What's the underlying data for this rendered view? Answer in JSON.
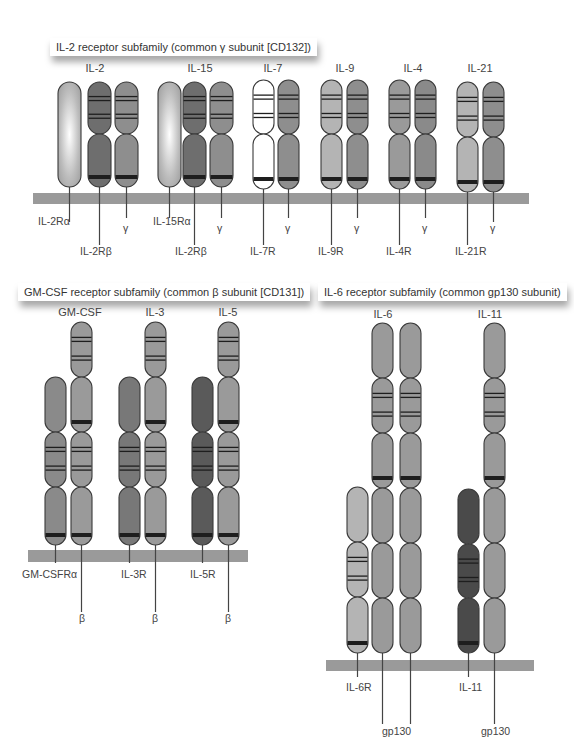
{
  "colors": {
    "membrane": "#9a9a9a",
    "outline": "#3a3a3a",
    "band": "#1e1e1e",
    "stalk": "#444444",
    "shades": {
      "alpha_light": "#c8c8c8",
      "beta_dark": "#6e6e6e",
      "gamma": "#8e8e8e",
      "white": "#ffffff",
      "light": "#b4b4b4",
      "mid": "#9a9a9a",
      "mid2": "#8a8a8a",
      "dark": "#787878",
      "darker": "#5a5a5a",
      "darkest": "#4a4a4a"
    }
  },
  "panels": [
    {
      "id": "il2",
      "title": "IL-2 receptor subfamily (common γ subunit [CD132])",
      "title_box": {
        "x": 50,
        "y": 38
      },
      "membrane": {
        "x": 33,
        "y": 193,
        "w": 250,
        "h": 10
      },
      "groups": [
        {
          "ligand": "IL-2",
          "ligand_x": 95
        },
        {
          "ligand": "IL-15",
          "ligand_x": 200
        },
        {
          "ligand": "IL-7",
          "ligand_x": 273
        },
        {
          "ligand": "IL-9",
          "ligand_x": 345
        },
        {
          "ligand": "IL-4",
          "ligand_x": 413
        },
        {
          "ligand": "IL-21",
          "ligand_x": 480
        }
      ],
      "ligand_y": 72
    },
    {
      "id": "gmcsf",
      "title": "GM-CSF receptor subfamily (common β subunit [CD131])",
      "title_box": {
        "x": 18,
        "y": 283
      },
      "groups": [
        {
          "ligand": "GM-CSF",
          "ligand_x": 80
        },
        {
          "ligand": "IL-3",
          "ligand_x": 155
        },
        {
          "ligand": "IL-5",
          "ligand_x": 228
        }
      ],
      "ligand_y": 316
    },
    {
      "id": "il6",
      "title": "IL-6 receptor subfamily (common gp130 subunit)",
      "title_box": {
        "x": 293,
        "y": 283
      },
      "groups": [
        {
          "ligand": "IL-6",
          "ligand_x": 383
        },
        {
          "ligand": "IL-11",
          "ligand_x": 490
        }
      ],
      "ligand_y": 318
    }
  ],
  "membranes": [
    {
      "x": 33,
      "y": 193,
      "w": 250,
      "h": 11
    },
    {
      "x": 283,
      "y": 193,
      "w": 246,
      "h": 11
    },
    {
      "x": 28,
      "y": 550,
      "w": 220,
      "h": 12
    },
    {
      "x": 326,
      "y": 660,
      "w": 208,
      "h": 11
    }
  ],
  "receptors": [
    {
      "name": "IL-2Rα",
      "x": 58,
      "w": 23,
      "top": 82,
      "bottom": 187,
      "fill": "alpha_light",
      "gradient": true,
      "segments": [
        [
          82,
          187,
          false
        ]
      ],
      "stalk_to": 222,
      "label": "IL-2Rα",
      "label_x": 38,
      "label_y": 225
    },
    {
      "name": "IL-2Rβ",
      "x": 88,
      "w": 23,
      "top": 82,
      "bottom": 187,
      "fill": "beta_dark",
      "segments": [
        [
          82,
          134,
          true
        ],
        [
          134,
          187,
          false,
          true
        ]
      ],
      "stalk_to": 245,
      "label": "IL-2Rβ",
      "label_x": 80,
      "label_y": 255
    },
    {
      "name": "γc-IL2",
      "x": 115,
      "w": 23,
      "top": 82,
      "bottom": 187,
      "fill": "gamma",
      "segments": [
        [
          82,
          134,
          true
        ],
        [
          134,
          187,
          false,
          true
        ]
      ],
      "stalk_to": 218,
      "label": "γ",
      "label_x": 123,
      "label_y": 232
    },
    {
      "name": "IL-15Rα",
      "x": 158,
      "w": 23,
      "top": 82,
      "bottom": 187,
      "fill": "alpha_light",
      "gradient": true,
      "segments": [
        [
          82,
          187,
          false
        ]
      ],
      "stalk_to": 218,
      "label": "IL-15Rα",
      "label_x": 153,
      "label_y": 225
    },
    {
      "name": "IL-2Rβb",
      "x": 183,
      "w": 23,
      "top": 82,
      "bottom": 187,
      "fill": "beta_dark",
      "segments": [
        [
          82,
          134,
          true
        ],
        [
          134,
          187,
          false,
          true
        ]
      ],
      "stalk_to": 245,
      "label": "IL-2Rβ",
      "label_x": 175,
      "label_y": 255
    },
    {
      "name": "γc-IL15",
      "x": 210,
      "w": 23,
      "top": 82,
      "bottom": 187,
      "fill": "gamma",
      "segments": [
        [
          82,
          134,
          true
        ],
        [
          134,
          187,
          false,
          true
        ]
      ],
      "stalk_to": 218,
      "label": "γ",
      "label_x": 217,
      "label_y": 232
    },
    {
      "name": "IL-7R",
      "x": 253,
      "w": 21,
      "top": 80,
      "bottom": 189,
      "fill": "white",
      "segments": [
        [
          80,
          134,
          true
        ],
        [
          134,
          189,
          false,
          true
        ]
      ],
      "stalk_to": 245,
      "label": "IL-7R",
      "label_x": 250,
      "label_y": 255
    },
    {
      "name": "γc-IL7",
      "x": 278,
      "w": 21,
      "top": 80,
      "bottom": 189,
      "fill": "gamma",
      "segments": [
        [
          80,
          134,
          true
        ],
        [
          134,
          189,
          false,
          true
        ]
      ],
      "stalk_to": 218,
      "label": "γ",
      "label_x": 285,
      "label_y": 232
    },
    {
      "name": "IL-9R",
      "x": 321,
      "w": 21,
      "top": 80,
      "bottom": 189,
      "fill": "light",
      "segments": [
        [
          80,
          134,
          true
        ],
        [
          134,
          189,
          false,
          true
        ]
      ],
      "stalk_to": 245,
      "label": "IL-9R",
      "label_x": 318,
      "label_y": 255
    },
    {
      "name": "γc-IL9",
      "x": 347,
      "w": 21,
      "top": 80,
      "bottom": 189,
      "fill": "gamma",
      "segments": [
        [
          80,
          134,
          true
        ],
        [
          134,
          189,
          false,
          true
        ]
      ],
      "stalk_to": 218,
      "label": "γ",
      "label_x": 354,
      "label_y": 232
    },
    {
      "name": "IL-4R",
      "x": 389,
      "w": 21,
      "top": 80,
      "bottom": 189,
      "fill": "mid",
      "segments": [
        [
          80,
          134,
          true
        ],
        [
          134,
          189,
          false,
          true
        ]
      ],
      "stalk_to": 245,
      "label": "IL-4R",
      "label_x": 386,
      "label_y": 255
    },
    {
      "name": "γc-IL4",
      "x": 415,
      "w": 21,
      "top": 80,
      "bottom": 189,
      "fill": "mid2",
      "segments": [
        [
          80,
          134,
          true
        ],
        [
          134,
          189,
          false,
          true
        ]
      ],
      "stalk_to": 218,
      "label": "γ",
      "label_x": 422,
      "label_y": 232
    },
    {
      "name": "IL-21R",
      "x": 457,
      "w": 21,
      "top": 82,
      "bottom": 192,
      "fill": "light",
      "segments": [
        [
          82,
          137,
          true
        ],
        [
          137,
          192,
          false,
          true
        ]
      ],
      "stalk_to": 245,
      "label": "IL-21R",
      "label_x": 455,
      "label_y": 255
    },
    {
      "name": "γc-IL21",
      "x": 483,
      "w": 21,
      "top": 82,
      "bottom": 192,
      "fill": "gamma",
      "segments": [
        [
          82,
          137,
          true
        ],
        [
          137,
          192,
          false,
          true
        ]
      ],
      "stalk_to": 222,
      "label": "γ",
      "label_x": 490,
      "label_y": 232
    },
    {
      "name": "GM-CSFRα",
      "x": 45,
      "w": 21,
      "top": 377,
      "bottom": 545,
      "fill": "mid2",
      "segments": [
        [
          377,
          432,
          false
        ],
        [
          432,
          487,
          true
        ],
        [
          487,
          545,
          false,
          true
        ]
      ],
      "stalk_to": 563,
      "label": "GM-CSFRα",
      "label_x": 22,
      "label_y": 578
    },
    {
      "name": "βc-GM",
      "x": 71,
      "w": 21,
      "top": 322,
      "bottom": 545,
      "fill": "mid",
      "segments": [
        [
          322,
          377,
          true
        ],
        [
          377,
          432,
          false,
          true
        ],
        [
          432,
          487,
          true
        ],
        [
          487,
          545,
          false,
          true
        ]
      ],
      "stalk_to": 612,
      "label": "β",
      "label_x": 79,
      "label_y": 622
    },
    {
      "name": "IL-3R",
      "x": 119,
      "w": 21,
      "top": 377,
      "bottom": 545,
      "fill": "dark",
      "segments": [
        [
          377,
          432,
          false
        ],
        [
          432,
          487,
          true
        ],
        [
          487,
          545,
          false,
          true
        ]
      ],
      "stalk_to": 563,
      "label": "IL-3R",
      "label_x": 121,
      "label_y": 578
    },
    {
      "name": "βc-IL3",
      "x": 145,
      "w": 21,
      "top": 322,
      "bottom": 545,
      "fill": "mid",
      "segments": [
        [
          322,
          377,
          true
        ],
        [
          377,
          432,
          false,
          true
        ],
        [
          432,
          487,
          true
        ],
        [
          487,
          545,
          false,
          true
        ]
      ],
      "stalk_to": 612,
      "label": "β",
      "label_x": 152,
      "label_y": 622
    },
    {
      "name": "IL-5R",
      "x": 192,
      "w": 21,
      "top": 377,
      "bottom": 545,
      "fill": "darker",
      "segments": [
        [
          377,
          432,
          false
        ],
        [
          432,
          487,
          true
        ],
        [
          487,
          545,
          false,
          true
        ]
      ],
      "stalk_to": 563,
      "label": "IL-5R",
      "label_x": 190,
      "label_y": 578
    },
    {
      "name": "βc-IL5",
      "x": 218,
      "w": 21,
      "top": 322,
      "bottom": 545,
      "fill": "mid",
      "segments": [
        [
          322,
          377,
          true
        ],
        [
          377,
          432,
          false,
          true
        ],
        [
          432,
          487,
          true
        ],
        [
          487,
          545,
          false,
          true
        ]
      ],
      "stalk_to": 612,
      "label": "β",
      "label_x": 225,
      "label_y": 622
    },
    {
      "name": "IL-6R",
      "x": 347,
      "w": 21,
      "top": 487,
      "bottom": 653,
      "fill": "light",
      "segments": [
        [
          487,
          542,
          false
        ],
        [
          542,
          597,
          true
        ],
        [
          597,
          653,
          false,
          true
        ]
      ],
      "stalk_to": 677,
      "label": "IL-6R",
      "label_x": 346,
      "label_y": 691
    },
    {
      "name": "gp130-a",
      "x": 372,
      "w": 21,
      "top": 323,
      "bottom": 653,
      "fill": "mid",
      "segments": [
        [
          323,
          378,
          false
        ],
        [
          378,
          433,
          true
        ],
        [
          433,
          488,
          false,
          true
        ],
        [
          488,
          543,
          false
        ],
        [
          543,
          598,
          false
        ],
        [
          598,
          653,
          false
        ]
      ],
      "stalk_to": 724,
      "label": "gp130",
      "label_x": 382,
      "label_y": 735
    },
    {
      "name": "gp130-b",
      "x": 400,
      "w": 21,
      "top": 323,
      "bottom": 653,
      "fill": "mid",
      "segments": [
        [
          323,
          378,
          false
        ],
        [
          378,
          433,
          true
        ],
        [
          433,
          488,
          false,
          true
        ],
        [
          488,
          543,
          false
        ],
        [
          543,
          598,
          false
        ],
        [
          598,
          653,
          false
        ]
      ],
      "stalk_to": 724,
      "label": "",
      "label_x": 0,
      "label_y": 0
    },
    {
      "name": "IL-11R",
      "x": 458,
      "w": 21,
      "top": 489,
      "bottom": 653,
      "fill": "darkest",
      "segments": [
        [
          489,
          544,
          false
        ],
        [
          544,
          598,
          true
        ],
        [
          598,
          653,
          false,
          true
        ]
      ],
      "stalk_to": 677,
      "label": "IL-11",
      "label_x": 459,
      "label_y": 691
    },
    {
      "name": "gp130-c",
      "x": 484,
      "w": 21,
      "top": 323,
      "bottom": 653,
      "fill": "mid",
      "segments": [
        [
          323,
          378,
          false
        ],
        [
          378,
          433,
          true
        ],
        [
          433,
          488,
          false,
          true
        ],
        [
          488,
          543,
          false
        ],
        [
          543,
          598,
          false
        ],
        [
          598,
          653,
          false
        ]
      ],
      "stalk_to": 724,
      "label": "gp130",
      "label_x": 481,
      "label_y": 735
    }
  ]
}
